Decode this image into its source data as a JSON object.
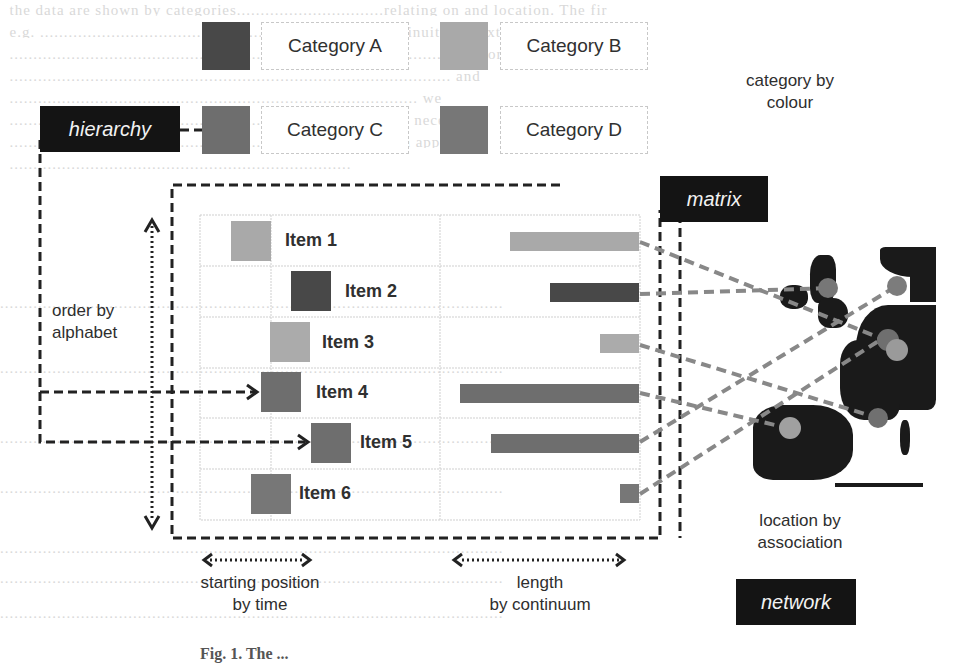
{
  "colors": {
    "category_a": "#484848",
    "category_b": "#a9a9a9",
    "category_c": "#6e6e6e",
    "category_d": "#777777",
    "dark_tag_bg": "#141414",
    "map_land": "#1a1a1a",
    "map_dot": "#7a7a7a",
    "connector": "#8a8a8a"
  },
  "legend": {
    "categories": [
      {
        "label": "Category A",
        "color": "#484848"
      },
      {
        "label": "Category B",
        "color": "#a9a9a9"
      },
      {
        "label": "Category C",
        "color": "#6e6e6e"
      },
      {
        "label": "Category D",
        "color": "#777777"
      }
    ],
    "caption": "category by colour"
  },
  "tags": {
    "hierarchy": "hierarchy",
    "matrix": "matrix",
    "network": "network"
  },
  "annotations": {
    "order_line1": "order by",
    "order_line2": "alphabet",
    "start_line1": "starting position",
    "start_line2": "by time",
    "length_line1": "length",
    "length_line2": "by continuum",
    "location_line1": "location by",
    "location_line2": "association"
  },
  "matrix": {
    "items": [
      {
        "label": "Item 1",
        "category": "B",
        "start_x": 231,
        "bar_left": 510,
        "bar_right": 639
      },
      {
        "label": "Item 2",
        "category": "A",
        "start_x": 291,
        "bar_left": 550,
        "bar_right": 639
      },
      {
        "label": "Item 3",
        "category": "B",
        "start_x": 270,
        "bar_left": 600,
        "bar_right": 639
      },
      {
        "label": "Item 4",
        "category": "C",
        "start_x": 261,
        "bar_left": 460,
        "bar_right": 639
      },
      {
        "label": "Item 5",
        "category": "C",
        "start_x": 311,
        "bar_left": 491,
        "bar_right": 639
      },
      {
        "label": "Item 6",
        "category": "D",
        "start_x": 251,
        "bar_left": 620,
        "bar_right": 639
      }
    ]
  },
  "figure_caption": "Fig. 1. The ..."
}
